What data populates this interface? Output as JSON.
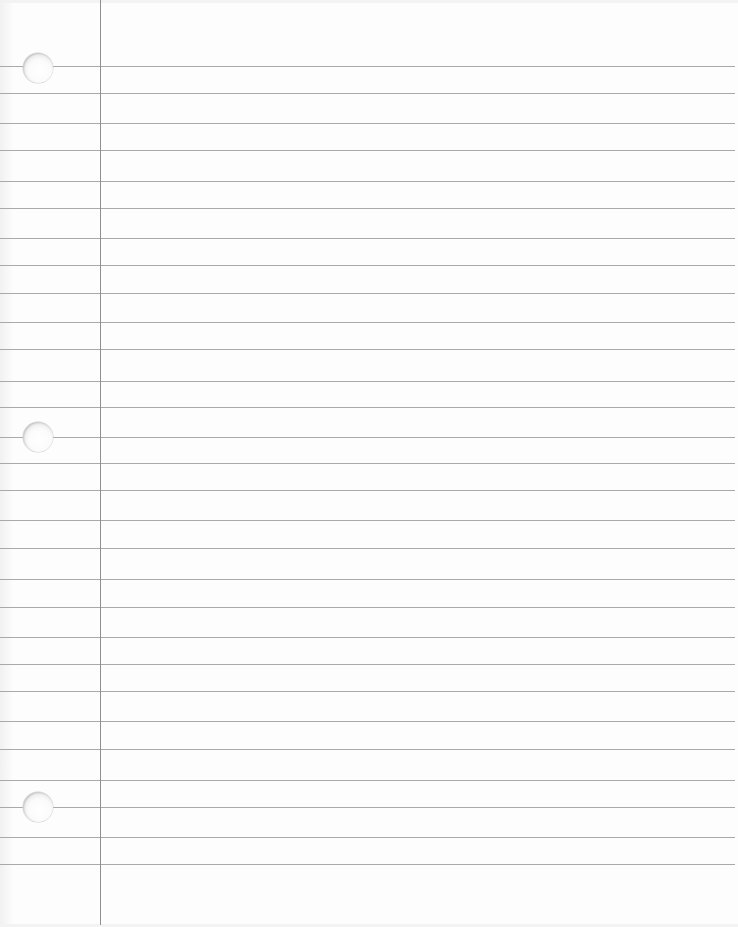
{
  "page": {
    "type": "lined-notebook-paper",
    "background_color": "#fdfdfd",
    "rule_color": "#a9a9a9",
    "margin_color": "#8f8f8f",
    "width": 738,
    "height": 927
  },
  "margin_line": {
    "x": 100,
    "top": 0,
    "bottom": 925
  },
  "rules": {
    "right_end": 735,
    "y_positions": [
      66,
      93,
      123,
      150,
      181,
      208,
      238,
      265,
      293,
      322,
      349,
      381,
      407,
      437,
      463,
      490,
      520,
      548,
      579,
      607,
      637,
      664,
      691,
      721,
      749,
      780,
      807,
      837,
      864
    ]
  },
  "punch_holes": [
    {
      "cx": 38,
      "cy": 68,
      "r": 15
    },
    {
      "cx": 38,
      "cy": 437,
      "r": 15
    },
    {
      "cx": 38,
      "cy": 807,
      "r": 15
    }
  ]
}
